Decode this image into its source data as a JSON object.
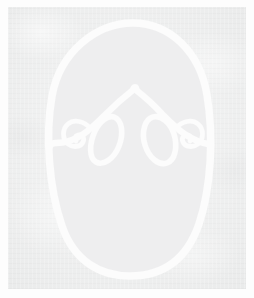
{
  "artwork": {
    "medium_description": "white marker line drawing on light gray scanned paper",
    "subject": "stylized face outline with brows, eyes and spiral flourishes",
    "canvas": {
      "width": 254,
      "height": 298
    },
    "palette": {
      "image_border": "#fdfdfd",
      "paper_outer": "#e9eaea",
      "paper_inner_face": "#eeeeef",
      "ink_white": "#fcfcfc",
      "ink_white_soft": "#f7f8f8"
    },
    "layout": {
      "paper_inset_left": 8,
      "paper_inset_top": 7,
      "paper_width": 238,
      "paper_height": 282
    },
    "strokes": {
      "face_outline": {
        "label": "face-oval",
        "path": "M 133 23 C 170 23 200 52 207 95 C 214 137 211 188 199 224 C 186 262 160 276 130 276 C 100 276 74 261 62 226 C 49 188 45 136 52 96 C 60 52 96 23 133 23 Z",
        "width": 7.5
      },
      "brow_left": {
        "label": "left-brow",
        "path": "M 133 90 C 124 97 115 105 106 114 C 98 122 90 130 82 135 C 74 140 65 143 56 143 C 53 143 51 144 50 146",
        "width": 6.4
      },
      "brow_right": {
        "label": "right-brow",
        "path": "M 136 90 C 145 97 154 105 162 114 C 170 122 178 130 186 135 C 194 140 202 143 208 144",
        "width": 6.4
      },
      "brow_peak": {
        "label": "brow-peak",
        "path": "M 133 90 C 133 88 134 87 135 87 C 136 87 137 88 136 90",
        "width": 6.0
      },
      "eye_left": {
        "label": "left-eye",
        "path": "M 114 117 C 122 120 124 133 119 146 C 114 159 103 166 96 162 C 89 158 89 144 95 131 C 100 121 108 115 114 117 Z",
        "width": 5.6
      },
      "eye_right": {
        "label": "right-eye",
        "path": "M 153 117 C 161 115 170 122 174 134 C 178 147 175 160 167 163 C 159 166 149 158 145 145 C 141 132 145 119 153 117 Z",
        "width": 5.6
      },
      "spiral_left": {
        "label": "left-spiral-flourish",
        "path": "M 90 128 C 84 121 74 119 68 124 C 62 129 62 139 68 144 C 73 148 81 147 83 142 C 85 138 82 134 78 135 C 75 136 74 139 76 141",
        "width": 4.8
      },
      "spiral_right": {
        "label": "right-spiral-flourish",
        "path": "M 176 128 C 182 121 192 119 198 124 C 204 129 204 139 198 144 C 193 148 185 147 183 142 C 181 138 184 134 188 135 C 191 136 192 139 190 141",
        "width": 4.8
      }
    }
  }
}
